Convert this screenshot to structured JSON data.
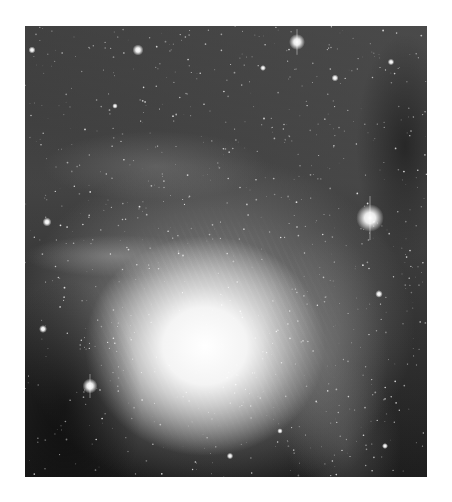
{
  "image": {
    "subject": "nebula-photograph",
    "colormode": "grayscale",
    "frame": {
      "x": 25,
      "y": 26,
      "width": 402,
      "height": 451
    },
    "colors": {
      "background": "#ffffff",
      "sky": "#1c1c1c",
      "core": "#ffffff"
    },
    "bright_stars": [
      {
        "x": 272,
        "y": 16,
        "r": 3.2
      },
      {
        "x": 113,
        "y": 24,
        "r": 2.2
      },
      {
        "x": 345,
        "y": 192,
        "r": 5.5
      },
      {
        "x": 65,
        "y": 360,
        "r": 3.0
      },
      {
        "x": 7,
        "y": 24,
        "r": 1.4
      },
      {
        "x": 310,
        "y": 52,
        "r": 1.4
      },
      {
        "x": 366,
        "y": 36,
        "r": 1.3
      },
      {
        "x": 22,
        "y": 196,
        "r": 1.8
      },
      {
        "x": 18,
        "y": 303,
        "r": 1.6
      },
      {
        "x": 354,
        "y": 268,
        "r": 1.5
      },
      {
        "x": 238,
        "y": 42,
        "r": 1.2
      },
      {
        "x": 90,
        "y": 80,
        "r": 1.1
      },
      {
        "x": 205,
        "y": 430,
        "r": 1.3
      },
      {
        "x": 360,
        "y": 420,
        "r": 1.2
      },
      {
        "x": 255,
        "y": 405,
        "r": 1.1
      }
    ],
    "field_star_count": 900,
    "field_star_seed": 42
  }
}
